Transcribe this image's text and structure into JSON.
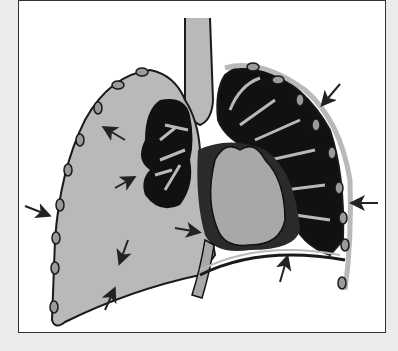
{
  "figure": {
    "colors": {
      "background": "#ebebeb",
      "panel": "#ffffff",
      "pleural_space": "#b9b9b9",
      "lung_tissue": "#111111",
      "heart": "#a8a8a8",
      "outline": "#1a1a1a"
    },
    "arrows": [
      {
        "id": "upper-left-inner",
        "x": 115,
        "y": 133
      },
      {
        "id": "mid-left-inner",
        "x": 125,
        "y": 180
      },
      {
        "id": "left-outer",
        "x": 45,
        "y": 210
      },
      {
        "id": "lower-left-inner",
        "x": 123,
        "y": 255
      },
      {
        "id": "bottom-left-outer",
        "x": 110,
        "y": 298
      },
      {
        "id": "heart-left",
        "x": 195,
        "y": 232
      },
      {
        "id": "upper-right-outer",
        "x": 330,
        "y": 95
      },
      {
        "id": "right-outer",
        "x": 362,
        "y": 203
      },
      {
        "id": "bottom-right-outer",
        "x": 285,
        "y": 268
      }
    ]
  }
}
